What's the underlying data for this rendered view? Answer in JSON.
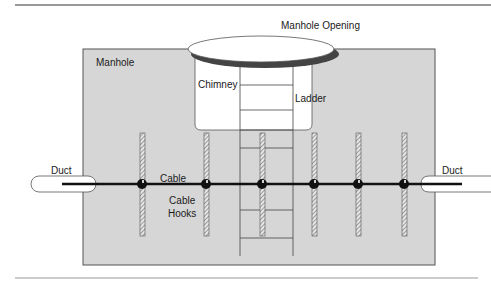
{
  "diagram": {
    "labels": {
      "manhole": "Manhole",
      "manhole_opening": "Manhole Opening",
      "chimney": "Chimney",
      "ladder": "Ladder",
      "cable": "Cable",
      "cable_hooks_line1": "Cable",
      "cable_hooks_line2": "Hooks",
      "duct_left": "Duct",
      "duct_right": "Duct"
    },
    "colors": {
      "manhole_fill": "#d4d4d4",
      "manhole_border": "#555555",
      "chimney_fill": "#ffffff",
      "cable": "#111111",
      "rule": "#777777",
      "hook_fill": "#c8c8c8"
    },
    "hooks_x": [
      142,
      206,
      262,
      314,
      358,
      404
    ],
    "ladder_rungs_y": [
      85,
      110,
      130,
      148,
      210,
      238
    ]
  }
}
